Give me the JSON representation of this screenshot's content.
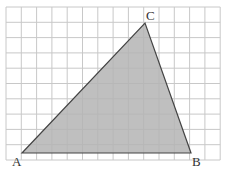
{
  "diagram": {
    "type": "triangle-on-grid",
    "grid": {
      "columns": 14,
      "rows": 10,
      "origin_px": [
        6,
        7
      ],
      "cell_px": 15.3,
      "line_color": "#c8c8c8"
    },
    "triangle": {
      "fill": "#b4b4b4",
      "stroke": "#444444",
      "vertices": [
        {
          "name": "A",
          "grid": [
            1,
            9.4
          ],
          "label": "A"
        },
        {
          "name": "B",
          "grid": [
            12,
            9.4
          ],
          "label": "B"
        },
        {
          "name": "C",
          "grid": [
            9,
            1
          ],
          "label": "C"
        }
      ]
    },
    "labels": {
      "A": "A",
      "B": "B",
      "C": "C"
    }
  }
}
